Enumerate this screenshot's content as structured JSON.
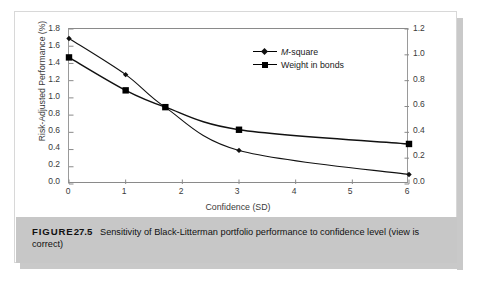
{
  "figure": {
    "caption_head": "FIGURE",
    "caption_number": "27.5",
    "caption_body": "Sensitivity of Black-Litterman portfolio performance to confidence level (view is correct)"
  },
  "chart_data": {
    "type": "line",
    "title": "",
    "xlabel": "Confidence (SD)",
    "ylabel": "Risk-Adjusted Performance (%)",
    "ylabel_right": "",
    "xlim": [
      0,
      6
    ],
    "ylim": [
      0.0,
      1.8
    ],
    "ylim_right": [
      0.0,
      1.2
    ],
    "grid": false,
    "legend_position": "top-right",
    "xticks": [
      "0",
      "1",
      "2",
      "3",
      "4",
      "5",
      "6"
    ],
    "xtick_values": [
      0,
      1,
      2,
      3,
      4,
      5,
      6
    ],
    "yticks": [
      "0.0",
      "0.2",
      "0.4",
      "0.6",
      "0.8",
      "1.0",
      "1.2",
      "1.4",
      "1.6",
      "1.8"
    ],
    "ytick_values": [
      0.0,
      0.2,
      0.4,
      0.6,
      0.8,
      1.0,
      1.2,
      1.4,
      1.6,
      1.8
    ],
    "yticks_right": [
      "0.0",
      "0.2",
      "0.4",
      "0.6",
      "0.8",
      "1.0",
      "1.2"
    ],
    "ytick_values_right": [
      0.0,
      0.2,
      0.4,
      0.6,
      0.8,
      1.0,
      1.2
    ],
    "series": [
      {
        "name": "M-square",
        "axis": "left",
        "marker": "diamond",
        "x": [
          0,
          1,
          1.7,
          3,
          6
        ],
        "values": [
          1.69,
          1.27,
          0.89,
          0.39,
          0.11
        ]
      },
      {
        "name": "Weight in bonds",
        "axis": "right",
        "marker": "square",
        "x": [
          0,
          1,
          1.7,
          3,
          6
        ],
        "values": [
          0.98,
          0.725,
          0.595,
          0.42,
          0.31
        ]
      }
    ]
  },
  "legend": {
    "items": [
      {
        "label_prefix": "M",
        "label_rest": "-square"
      },
      {
        "label_prefix": "",
        "label_rest": "Weight in bonds"
      }
    ]
  }
}
